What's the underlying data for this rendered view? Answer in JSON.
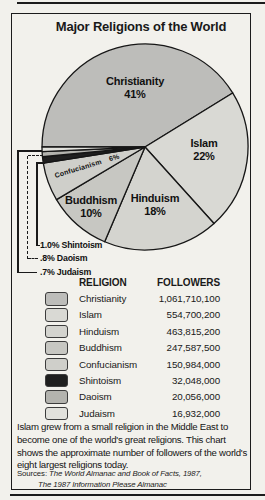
{
  "title": "Major Religions of the World",
  "chart_data": {
    "type": "pie",
    "title": "Major Religions of the World",
    "direction": "clockwise",
    "start_angle_deg": 180,
    "slices": [
      {
        "label": "Christianity",
        "pct": 41,
        "pct_label": "41%",
        "followers": "1,061,710,100",
        "color": "#bdbdba"
      },
      {
        "label": "Islam",
        "pct": 22,
        "pct_label": "22%",
        "followers": "554,700,200",
        "color": "#d9d9d4"
      },
      {
        "label": "Hinduism",
        "pct": 18,
        "pct_label": "18%",
        "followers": "463,815,200",
        "color": "#d4d4cf"
      },
      {
        "label": "Buddhism",
        "pct": 10,
        "pct_label": "10%",
        "followers": "247,587,500",
        "color": "#c7c7c2"
      },
      {
        "label": "Confucianism",
        "pct": 6,
        "pct_label": "6%",
        "followers": "150,984,000",
        "color": "#cfcfca"
      },
      {
        "label": "Shintoism",
        "pct": 1.0,
        "pct_label": "1.0%",
        "followers": "32,048,000",
        "color": "#1f1f1f"
      },
      {
        "label": "Daoism",
        "pct": 0.8,
        "pct_label": ".8%",
        "followers": "20,056,000",
        "color": "#b3b3ae"
      },
      {
        "label": "Judaism",
        "pct": 0.7,
        "pct_label": ".7%",
        "followers": "16,932,000",
        "color": "#e1e1dc"
      }
    ]
  },
  "table": {
    "col_religion": "RELIGION",
    "col_followers": "FOLLOWERS"
  },
  "caption": "Islam grew from a small religion in the Middle East to become one of the world's great religions. This chart shows the approximate number of followers of the world's eight largest religions today.",
  "sources": {
    "prefix": "Sources:",
    "line1": "The World Almanac and Book of Facts, 1987,",
    "line2": "The 1987 Information Please Almanac"
  }
}
